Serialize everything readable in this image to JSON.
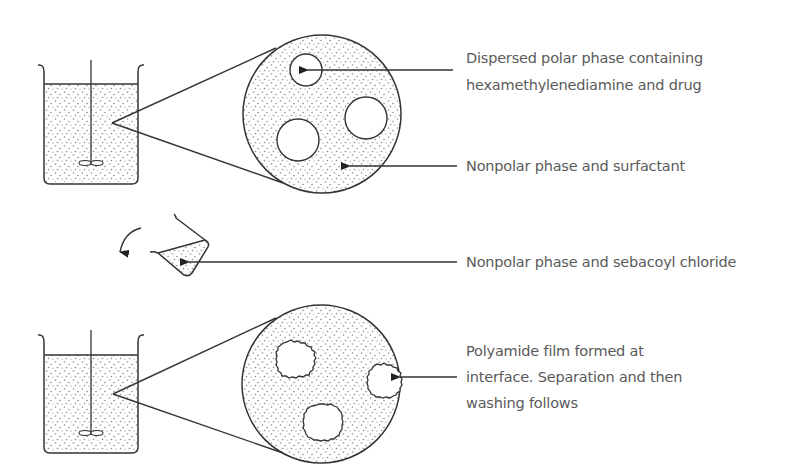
{
  "diagram": {
    "type": "process-illustration",
    "colors": {
      "stroke": "#333333",
      "text": "#5a5a5a",
      "dots": "#8a8a8a",
      "background": "#ffffff"
    },
    "labels": {
      "dispersed_polar_line1": "Dispersed polar phase containing",
      "dispersed_polar_line2": "hexamethylenediamine and drug",
      "nonpolar_surfactant": "Nonpolar phase and surfactant",
      "nonpolar_sebacoyl": "Nonpolar phase and sebacoyl chloride",
      "polyamide_line1": "Polyamide film formed at",
      "polyamide_line2": "interface. Separation and then",
      "polyamide_line3": "washing follows"
    },
    "stages": [
      {
        "name": "emulsion",
        "elements": [
          "beaker-with-stirrer",
          "magnified-view-with-droplets"
        ]
      },
      {
        "name": "addition",
        "elements": [
          "tilted-beaker-pouring",
          "curved-pour-arrow"
        ]
      },
      {
        "name": "encapsulation",
        "elements": [
          "beaker-with-stirrer",
          "magnified-view-with-capsules"
        ]
      }
    ]
  }
}
